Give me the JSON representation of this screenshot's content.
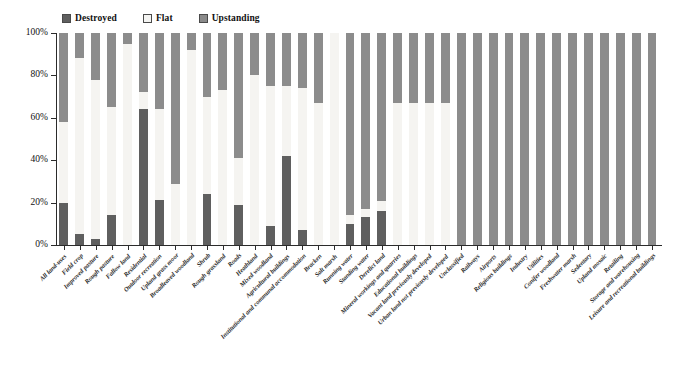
{
  "legend": {
    "items": [
      {
        "label": "Destroyed",
        "color": "#5f5f5f",
        "key": "destroyed"
      },
      {
        "label": "Flat",
        "color": "#f5f4f1",
        "key": "flat"
      },
      {
        "label": "Upstanding",
        "color": "#8c8c8c",
        "key": "upstanding"
      }
    ]
  },
  "axes": {
    "y_ticks": [
      "0%",
      "20%",
      "40%",
      "60%",
      "80%",
      "100%"
    ],
    "y_min": 0,
    "y_max": 100,
    "x_label": "",
    "y_label": ""
  },
  "chart_data": {
    "type": "bar",
    "title": "",
    "subtitle": "",
    "xlabel": "",
    "ylabel": "",
    "ylim": [
      0,
      100
    ],
    "stacked": true,
    "stack_order": [
      "Destroyed",
      "Flat",
      "Upstanding"
    ],
    "grid": false,
    "legend_position": "top",
    "legend": [
      "Destroyed",
      "Flat",
      "Upstanding"
    ],
    "categories": [
      "All land-uses",
      "Field crop",
      "Improved pasture",
      "Rough pasture",
      "Fallow land",
      "Residential",
      "Outdoor recreation",
      "Upland grass moor",
      "Broadleaved woodland",
      "Shrub",
      "Rough grassland",
      "Roads",
      "Heathland",
      "Mixed woodland",
      "Agricultural buildings",
      "Institutional and communal accommodation",
      "Bracken",
      "Salt marsh",
      "Running water",
      "Standing water",
      "Derelict land",
      "Mineral workings and quarries",
      "Educational buildings",
      "Vacant land previously developed",
      "Urban land not previously developed",
      "Unclassified",
      "Railways",
      "Airports",
      "Religious buildings",
      "Industry",
      "Utilities",
      "Conifer woodland",
      "Freshwater marsh",
      "Sedentary",
      "Upland mosaic",
      "Retailing",
      "Storage and warehousing",
      "Leisure and recreational buildings"
    ],
    "series": [
      {
        "name": "Destroyed",
        "color": "#5f5f5f",
        "values": [
          20,
          5,
          3,
          14,
          0,
          64,
          21,
          0,
          0,
          24,
          0,
          19,
          0,
          9,
          42,
          7,
          0,
          0,
          10,
          13,
          16,
          0,
          0,
          0,
          0,
          0,
          0,
          0,
          0,
          0,
          0,
          0,
          0,
          0,
          0,
          0,
          0,
          0
        ]
      },
      {
        "name": "Flat",
        "color": "#f5f4f1",
        "values": [
          38,
          83,
          75,
          51,
          95,
          8,
          43,
          29,
          92,
          46,
          73,
          22,
          80,
          66,
          33,
          67,
          67,
          100,
          4,
          4,
          5,
          67,
          67,
          67,
          67,
          0,
          0,
          0,
          0,
          0,
          0,
          0,
          0,
          0,
          0,
          0,
          0,
          0
        ]
      },
      {
        "name": "Upstanding",
        "color": "#8c8c8c",
        "values": [
          42,
          12,
          22,
          35,
          5,
          28,
          36,
          71,
          8,
          30,
          27,
          59,
          20,
          25,
          25,
          26,
          33,
          0,
          86,
          83,
          79,
          33,
          33,
          33,
          33,
          100,
          100,
          100,
          100,
          100,
          100,
          100,
          100,
          100,
          100,
          100,
          100,
          100
        ]
      }
    ]
  }
}
